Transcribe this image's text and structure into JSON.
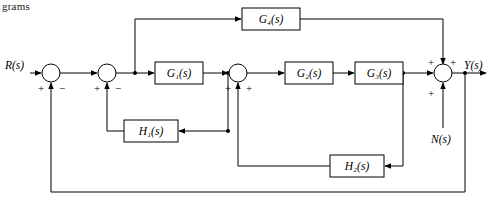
{
  "page": {
    "corner_text": "grams"
  },
  "diagram": {
    "blocks": [
      {
        "name": "block-g4",
        "label": "G₄(s)",
        "x": 242,
        "y": 8,
        "w": 58,
        "h": 22
      },
      {
        "name": "block-g1",
        "label": "G₁(s)",
        "x": 155,
        "y": 62,
        "w": 48,
        "h": 22
      },
      {
        "name": "block-g2",
        "label": "G₂(s)",
        "x": 285,
        "y": 62,
        "w": 48,
        "h": 22
      },
      {
        "name": "block-g3",
        "label": "G₃(s)",
        "x": 355,
        "y": 62,
        "w": 48,
        "h": 22
      },
      {
        "name": "block-h1",
        "label": "H₁(s)",
        "x": 124,
        "y": 120,
        "w": 54,
        "h": 22
      },
      {
        "name": "block-h2",
        "label": "H₂(s)",
        "x": 330,
        "y": 155,
        "w": 54,
        "h": 22
      }
    ],
    "summers": [
      {
        "name": "summing-junction-1",
        "cx": 51,
        "cy": 73,
        "r": 9
      },
      {
        "name": "summing-junction-2",
        "cx": 107,
        "cy": 73,
        "r": 9
      },
      {
        "name": "summing-junction-3",
        "cx": 238,
        "cy": 73,
        "r": 9
      },
      {
        "name": "summing-junction-4",
        "cx": 443,
        "cy": 73,
        "r": 9
      }
    ],
    "signals": [
      {
        "name": "signal-label-input",
        "label": "R(s)",
        "x": 5,
        "y": 66
      },
      {
        "name": "signal-label-output",
        "label": "Y(s)",
        "x": 464,
        "y": 66
      },
      {
        "name": "signal-label-disturbance",
        "label": "N(s)",
        "x": 431,
        "y": 132
      }
    ],
    "signs": [
      {
        "name": "sign-s1-plus",
        "label": "+",
        "x": 38,
        "y": 90
      },
      {
        "name": "sign-s1-minus",
        "label": "−",
        "x": 59,
        "y": 90
      },
      {
        "name": "sign-s2-plus",
        "label": "+",
        "x": 94,
        "y": 90
      },
      {
        "name": "sign-s2-minus",
        "label": "−",
        "x": 115,
        "y": 90
      },
      {
        "name": "sign-s3-plus",
        "label": "+",
        "x": 225,
        "y": 90
      },
      {
        "name": "sign-s3-plus-2",
        "label": "+",
        "x": 246,
        "y": 90
      },
      {
        "name": "sign-s4-plus-top",
        "label": "+",
        "x": 428,
        "y": 63
      },
      {
        "name": "sign-s4-plus-right",
        "label": "+",
        "x": 449,
        "y": 63
      },
      {
        "name": "sign-s4-plus-bottom",
        "label": "+",
        "x": 428,
        "y": 95
      }
    ]
  }
}
